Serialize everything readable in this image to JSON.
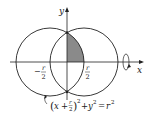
{
  "diagram": {
    "axes": {
      "x_label": "x",
      "y_label": "y"
    },
    "ticks": {
      "left_num": "r",
      "left_den": "2",
      "left_sign": "−",
      "right_num": "r",
      "right_den": "2"
    },
    "equation": {
      "open": "(",
      "x": "x",
      "plus": "+",
      "frac_num": "r",
      "frac_den": "2",
      "close": ")",
      "exp1": "2",
      "plus2": "+",
      "y": "y",
      "exp2": "2",
      "equals": "=",
      "r": "r",
      "exp3": "2"
    },
    "colors": {
      "stroke": "#222222",
      "shade": "#8a8a8a",
      "background": "#ffffff"
    },
    "circles": [
      {
        "name": "left-circle",
        "cx": 50,
        "cy": 62,
        "r": 34
      },
      {
        "name": "right-circle",
        "cx": 84,
        "cy": 62,
        "r": 34
      }
    ]
  }
}
